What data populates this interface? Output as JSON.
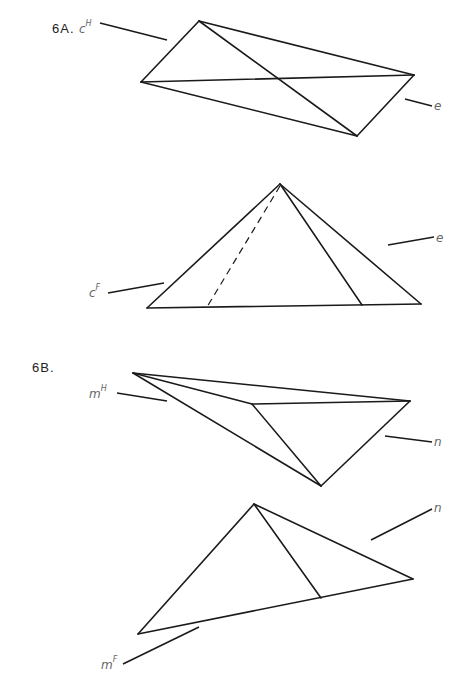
{
  "figures": [
    {
      "label": "6A.",
      "views": [
        {
          "name": "horizontal-view",
          "plane_label": {
            "base": "c",
            "sup": "H"
          },
          "line_label": {
            "base": "e"
          }
        },
        {
          "name": "frontal-view",
          "plane_label": {
            "base": "c",
            "sup": "F"
          },
          "line_label": {
            "base": "e"
          }
        }
      ]
    },
    {
      "label": "6B.",
      "views": [
        {
          "name": "horizontal-view",
          "plane_label": {
            "base": "m",
            "sup": "H"
          },
          "line_label": {
            "base": "n"
          }
        },
        {
          "name": "frontal-view",
          "plane_label": {
            "base": "m",
            "sup": "F"
          },
          "line_label": {
            "base": "n"
          }
        }
      ]
    }
  ],
  "colors": {
    "line": "#1a1a1a",
    "label": "#666666",
    "background": "#ffffff"
  }
}
